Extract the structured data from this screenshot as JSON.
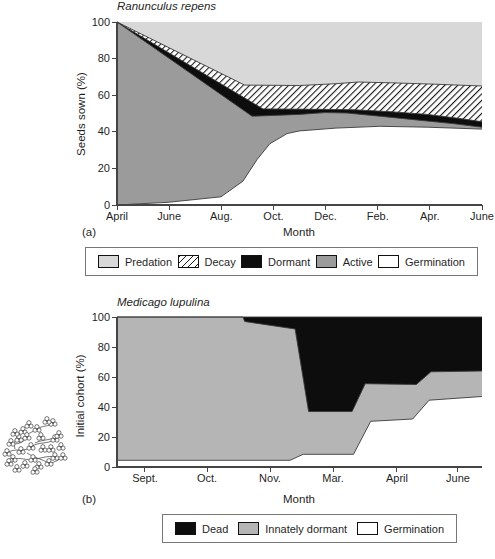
{
  "figure": {
    "panel_a_letter": "(a)",
    "panel_b_letter": "(b)",
    "axis_color": "#444444",
    "boundary_line_color": "#3a3a3a"
  },
  "chart_data": [
    {
      "type": "area",
      "title": "Ranunculus repens",
      "xlabel": "Month",
      "ylabel": "Seeds sown (%)",
      "panel_label": "(a)",
      "ylim": [
        0,
        100
      ],
      "y_ticks": [
        0,
        20,
        40,
        60,
        80,
        100
      ],
      "x_ticks": [
        {
          "t": 0.0,
          "label": "April"
        },
        {
          "t": 0.1429,
          "label": "June"
        },
        {
          "t": 0.2857,
          "label": "Aug."
        },
        {
          "t": 0.4286,
          "label": "Oct."
        },
        {
          "t": 0.5714,
          "label": "Dec."
        },
        {
          "t": 0.7143,
          "label": "Feb."
        },
        {
          "t": 0.8571,
          "label": "Apr."
        },
        {
          "t": 1.0,
          "label": "June"
        }
      ],
      "boundaries": {
        "germination_top": [
          [
            0,
            0
          ],
          [
            0.14,
            1.5
          ],
          [
            0.285,
            4.5
          ],
          [
            0.345,
            13
          ],
          [
            0.384,
            25
          ],
          [
            0.419,
            33.5
          ],
          [
            0.466,
            39
          ],
          [
            0.5,
            40.5
          ],
          [
            0.6,
            42
          ],
          [
            0.72,
            43
          ],
          [
            0.85,
            42.5
          ],
          [
            1,
            41.5
          ]
        ],
        "active_top": [
          [
            0,
            100
          ],
          [
            0.37,
            48.5
          ],
          [
            0.5,
            49.5
          ],
          [
            0.57,
            50.5
          ],
          [
            0.63,
            50.3
          ],
          [
            0.72,
            48.5
          ],
          [
            0.82,
            46.5
          ],
          [
            0.92,
            44.5
          ],
          [
            1,
            42.5
          ]
        ],
        "dormant_top": [
          [
            0,
            100
          ],
          [
            0.4,
            52.5
          ],
          [
            0.55,
            52.3
          ],
          [
            0.65,
            52
          ],
          [
            0.75,
            51
          ],
          [
            0.85,
            49.5
          ],
          [
            0.93,
            47.5
          ],
          [
            1,
            45.5
          ]
        ],
        "decay_top": [
          [
            0,
            100
          ],
          [
            0.35,
            65.5
          ],
          [
            0.5,
            65.3
          ],
          [
            0.6,
            66.3
          ],
          [
            0.66,
            67.2
          ],
          [
            0.75,
            66.8
          ],
          [
            0.87,
            66
          ],
          [
            1,
            65
          ]
        ]
      },
      "layers": [
        {
          "name": "Predation",
          "top": 100,
          "fill": "#d8d8d8"
        },
        {
          "name": "Decay",
          "top": "decay_top",
          "fill": "hatch"
        },
        {
          "name": "Dormant",
          "top": "dormant_top",
          "fill": "#0d0d0d"
        },
        {
          "name": "Active",
          "top": "active_top",
          "fill": "#9b9b9b"
        },
        {
          "name": "Germination",
          "top": "germination_top",
          "fill": "#ffffff"
        }
      ],
      "stroke_boundaries": [
        "decay_top",
        "dormant_top",
        "active_top",
        "germination_top"
      ],
      "legend": [
        {
          "label": "Predation",
          "fill": "#d8d8d8"
        },
        {
          "label": "Decay",
          "fill": "hatch"
        },
        {
          "label": "Dormant",
          "fill": "#0d0d0d"
        },
        {
          "label": "Active",
          "fill": "#9b9b9b"
        },
        {
          "label": "Germination",
          "fill": "#ffffff"
        }
      ]
    },
    {
      "type": "area",
      "title": "Medicago lupulina",
      "xlabel": "Month",
      "ylabel": "Initial cohort (%)",
      "panel_label": "(b)",
      "ylim": [
        0,
        100
      ],
      "y_ticks": [
        0,
        20,
        40,
        60,
        80,
        100
      ],
      "x_ticks": [
        {
          "t": 0.0767,
          "label": "Sept."
        },
        {
          "t": 0.2466,
          "label": "Oct."
        },
        {
          "t": 0.4192,
          "label": "Nov."
        },
        {
          "t": 0.5918,
          "label": "Mar."
        },
        {
          "t": 0.7671,
          "label": "April"
        },
        {
          "t": 0.9342,
          "label": "June"
        }
      ],
      "boundaries": {
        "top_frame": [
          [
            0,
            100
          ],
          [
            1,
            100
          ]
        ],
        "dead_bottom": [
          [
            0,
            100
          ],
          [
            0.345,
            100
          ],
          [
            0.35,
            97
          ],
          [
            0.488,
            92
          ],
          [
            0.525,
            37
          ],
          [
            0.644,
            37
          ],
          [
            0.68,
            55.5
          ],
          [
            0.82,
            55
          ],
          [
            0.86,
            63.5
          ],
          [
            1,
            64
          ]
        ],
        "germination_top": [
          [
            0,
            4.5
          ],
          [
            0.474,
            4.5
          ],
          [
            0.51,
            8.5
          ],
          [
            0.648,
            8.5
          ],
          [
            0.695,
            30.5
          ],
          [
            0.81,
            32
          ],
          [
            0.855,
            44.5
          ],
          [
            1,
            47
          ]
        ]
      },
      "layers": [
        {
          "name": "Dead",
          "top": 100,
          "fill": "#0d0d0d"
        },
        {
          "name": "Innately dormant",
          "top": "dead_bottom",
          "fill": "#b5b5b5"
        },
        {
          "name": "Germination",
          "top": "germination_top",
          "fill": "#ffffff"
        }
      ],
      "stroke_boundaries": [
        "top_frame",
        "dead_bottom",
        "germination_top"
      ],
      "legend": [
        {
          "label": "Dead",
          "fill": "#0d0d0d"
        },
        {
          "label": "Innately dormant",
          "fill": "#b5b5b5"
        },
        {
          "label": "Germination",
          "fill": "#ffffff"
        }
      ]
    }
  ]
}
